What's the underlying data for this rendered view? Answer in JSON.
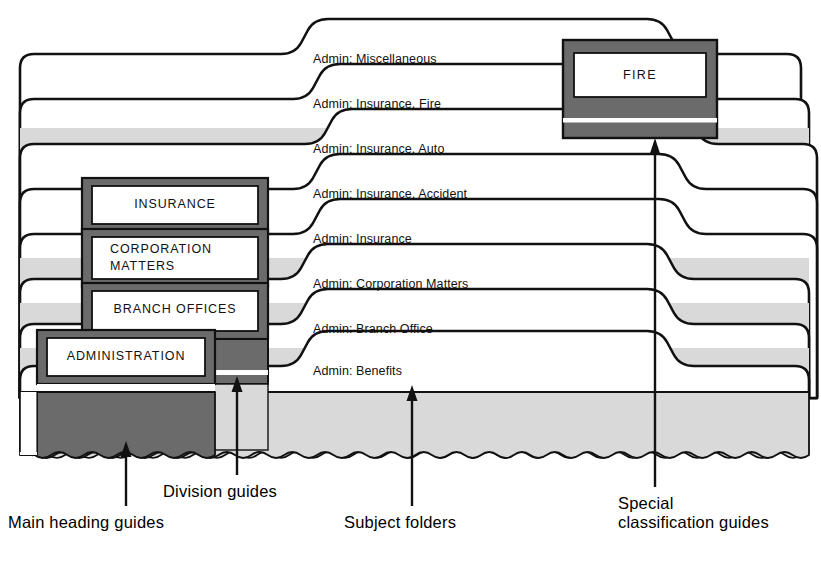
{
  "diagram": {
    "colors": {
      "dark_gray": "#6b6b6b",
      "light_gray": "#d9d9d9",
      "white": "#ffffff",
      "ink": "#111111"
    }
  },
  "subject_folders": [
    {
      "label": "Admin: Miscellaneous",
      "x": 313,
      "y": 58
    },
    {
      "label": "Admin: Insurance, Fire",
      "x": 313,
      "y": 103
    },
    {
      "label": "Admin: Insurance, Auto",
      "x": 313,
      "y": 148
    },
    {
      "label": "Admin: Insurance, Accident",
      "x": 313,
      "y": 193
    },
    {
      "label": "Admin: Insurance",
      "x": 313,
      "y": 238
    },
    {
      "label": "Admin: Corporation Matters",
      "x": 313,
      "y": 283
    },
    {
      "label": "Admin: Branch Office",
      "x": 313,
      "y": 328
    },
    {
      "label": "Admin: Benefits",
      "x": 313,
      "y": 370
    }
  ],
  "division_guides": [
    {
      "label": "INSURANCE",
      "lines": [
        "INSURANCE"
      ]
    },
    {
      "label": "CORPORATION MATTERS",
      "lines": [
        "CORPORATION",
        "MATTERS"
      ]
    },
    {
      "label": "BRANCH OFFICES",
      "lines": [
        "BRANCH OFFICES"
      ]
    }
  ],
  "main_heading_guide": {
    "label": "ADMINISTRATION"
  },
  "special_classification_guide": {
    "label": "FIRE"
  },
  "captions": [
    {
      "id": "main-heading-guides",
      "text": "Main heading guides",
      "lines": [
        "Main heading guides"
      ],
      "x": 8,
      "y": 521,
      "arrow_x": 126,
      "arrow_tip_y": 443,
      "arrow_tail_y": 506
    },
    {
      "id": "division-guides",
      "text": "Division guides",
      "lines": [
        "Division guides"
      ],
      "x": 163,
      "y": 490,
      "arrow_x": 237,
      "arrow_tip_y": 377,
      "arrow_tail_y": 475
    },
    {
      "id": "subject-folders",
      "text": "Subject folders",
      "lines": [
        "Subject folders"
      ],
      "x": 344,
      "y": 521,
      "arrow_x": 412,
      "arrow_tip_y": 386,
      "arrow_tail_y": 506
    },
    {
      "id": "special-classification",
      "text": "Special classification guides",
      "lines": [
        "Special",
        "classification guides"
      ],
      "x": 618,
      "y": 500,
      "arrow_x": 655,
      "arrow_tip_y": 138,
      "arrow_tail_y": 487
    }
  ]
}
